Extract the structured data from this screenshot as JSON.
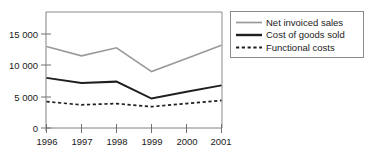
{
  "chart_data": {
    "type": "line",
    "title": "",
    "xlabel": "",
    "ylabel": "",
    "categories": [
      "1996",
      "1997",
      "1998",
      "1999",
      "2000",
      "2001"
    ],
    "x": [
      1996,
      1997,
      1998,
      1999,
      2000,
      2001
    ],
    "ylim": [
      0,
      16500
    ],
    "xlim": [
      1996,
      2001
    ],
    "yticks": [
      0,
      5000,
      10000,
      15000
    ],
    "ytick_labels": [
      "0",
      "5 000",
      "10 000",
      "15 000"
    ],
    "xtick_labels": [
      "1996",
      "1997",
      "1998",
      "1999",
      "2000",
      "2001"
    ],
    "grid": false,
    "legend_position": "right-top",
    "series": [
      {
        "name": "Net invoiced sales",
        "values": [
          13000,
          11500,
          12800,
          9000,
          11100,
          13200
        ],
        "color": "#9a9a9a",
        "style": "solid",
        "width": 1.7
      },
      {
        "name": "Cost of goods sold",
        "values": [
          8000,
          7200,
          7400,
          4700,
          5800,
          6800
        ],
        "color": "#1f1f1f",
        "style": "solid",
        "width": 2.0
      },
      {
        "name": "Functional costs",
        "values": [
          4200,
          3700,
          3900,
          3400,
          3900,
          4400
        ],
        "color": "#1f1f1f",
        "style": "dashed",
        "width": 1.7
      }
    ]
  },
  "legend": {
    "items": [
      {
        "label": "Net invoiced sales"
      },
      {
        "label": "Cost of goods sold"
      },
      {
        "label": "Functional costs"
      }
    ]
  },
  "axes": {
    "y_labels": [
      "15 000",
      "10 000",
      "5 000",
      "0"
    ],
    "x_labels": [
      "1996",
      "1997",
      "1998",
      "1999",
      "2000",
      "2001"
    ]
  },
  "colors": {
    "net_invoiced_sales": "#9a9a9a",
    "cost_of_goods_sold": "#1f1f1f",
    "functional_costs": "#1f1f1f",
    "axis": "#808080",
    "frame": "#8a8a8a",
    "background": "#ffffff"
  }
}
